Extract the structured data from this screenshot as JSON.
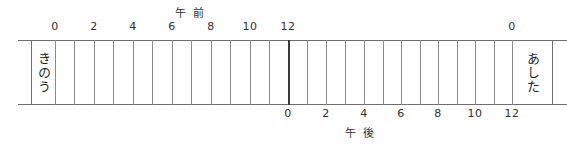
{
  "diagram": {
    "am_caption": {
      "chars": [
        "午",
        "前"
      ],
      "reading": "gozen (A.M.)"
    },
    "pm_caption": {
      "chars": [
        "午",
        "後"
      ],
      "reading": "gogo (P.M.)"
    },
    "yesterday_label": "きのう",
    "tomorrow_label": "あした",
    "am_ticks": [
      {
        "label": "0",
        "hour": 0,
        "x": 55
      },
      {
        "label": "2",
        "hour": 2,
        "x": 94
      },
      {
        "label": "4",
        "hour": 4,
        "x": 133
      },
      {
        "label": "6",
        "hour": 6,
        "x": 172
      },
      {
        "label": "8",
        "hour": 8,
        "x": 211
      },
      {
        "label": "10",
        "hour": 10,
        "x": 250
      },
      {
        "label": "12",
        "hour": 12,
        "x": 288
      },
      {
        "label": "0",
        "hour": 24,
        "x": 512
      }
    ],
    "pm_ticks": [
      {
        "label": "0",
        "hour": 12,
        "x": 288
      },
      {
        "label": "2",
        "hour": 14,
        "x": 326
      },
      {
        "label": "4",
        "hour": 16,
        "x": 364
      },
      {
        "label": "6",
        "hour": 18,
        "x": 401
      },
      {
        "label": "8",
        "hour": 20,
        "x": 438
      },
      {
        "label": "10",
        "hour": 22,
        "x": 475
      },
      {
        "label": "12",
        "hour": 24,
        "x": 512
      }
    ],
    "grid_lines": [
      {
        "x": 31,
        "kind": "edge"
      },
      {
        "x": 55,
        "kind": "minor"
      },
      {
        "x": 74,
        "kind": "minor"
      },
      {
        "x": 94,
        "kind": "minor"
      },
      {
        "x": 113,
        "kind": "minor"
      },
      {
        "x": 133,
        "kind": "minor"
      },
      {
        "x": 152,
        "kind": "minor"
      },
      {
        "x": 172,
        "kind": "minor"
      },
      {
        "x": 191,
        "kind": "minor"
      },
      {
        "x": 211,
        "kind": "minor"
      },
      {
        "x": 230,
        "kind": "minor"
      },
      {
        "x": 250,
        "kind": "minor"
      },
      {
        "x": 269,
        "kind": "minor"
      },
      {
        "x": 288,
        "kind": "major"
      },
      {
        "x": 307,
        "kind": "minor"
      },
      {
        "x": 326,
        "kind": "minor"
      },
      {
        "x": 345,
        "kind": "minor"
      },
      {
        "x": 364,
        "kind": "minor"
      },
      {
        "x": 383,
        "kind": "minor"
      },
      {
        "x": 401,
        "kind": "minor"
      },
      {
        "x": 420,
        "kind": "minor"
      },
      {
        "x": 438,
        "kind": "minor"
      },
      {
        "x": 457,
        "kind": "minor"
      },
      {
        "x": 475,
        "kind": "minor"
      },
      {
        "x": 494,
        "kind": "minor"
      },
      {
        "x": 512,
        "kind": "minor"
      },
      {
        "x": 552,
        "kind": "edge"
      }
    ],
    "colors": {
      "ink": "#2b2b2b",
      "rule": "#6e6e6e",
      "grid": "#8a8a8a",
      "noon_line": "#3a3a3a",
      "paper": "#ffffff"
    }
  }
}
